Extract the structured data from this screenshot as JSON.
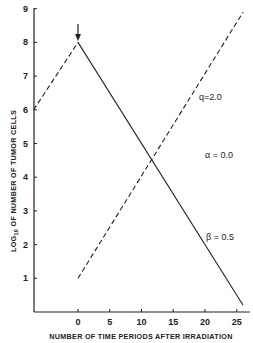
{
  "chart_data": {
    "type": "line",
    "title": "",
    "xlabel": "NUMBER OF TIME PERIODS AFTER IRRADIATION",
    "ylabel": "LOG10 OF NUMBER OF TUMOR CELLS",
    "ylabel_parts": {
      "pre": "LOG",
      "sub": "10",
      "post": " OF NUMBER OF TUMOR CELLS"
    },
    "xlim": [
      -7,
      26
    ],
    "ylim": [
      0,
      9
    ],
    "x_ticks": [
      0,
      5,
      10,
      15,
      20,
      25
    ],
    "x_tick_labels": [
      "0",
      "5",
      "10",
      "15",
      "20",
      "25"
    ],
    "y_ticks": [
      1,
      2,
      3,
      4,
      5,
      6,
      7,
      8,
      9
    ],
    "y_tick_labels": [
      "1",
      "2",
      "3",
      "4",
      "5",
      "6",
      "7",
      "8",
      "9"
    ],
    "grid": false,
    "series": [
      {
        "name": "pre-irradiation growth",
        "style": "dashed",
        "x": [
          -7,
          0
        ],
        "y": [
          6,
          8
        ]
      },
      {
        "name": "surviving cells decline",
        "style": "solid",
        "x": [
          0,
          26
        ],
        "y": [
          8,
          0.2
        ]
      },
      {
        "name": "regrowth",
        "style": "dashed",
        "x": [
          0,
          26
        ],
        "y": [
          1,
          8.9
        ]
      }
    ],
    "annotations": [
      {
        "text": "q=2.0",
        "x": 20,
        "y": 6.4
      },
      {
        "text": "α = 0.0",
        "x": 20,
        "y": 4.7
      },
      {
        "text": "β = 0.5",
        "x": 20,
        "y": 2.3
      },
      {
        "text": "arrow",
        "x": 0,
        "y": 8,
        "meaning": "irradiation time"
      }
    ]
  }
}
